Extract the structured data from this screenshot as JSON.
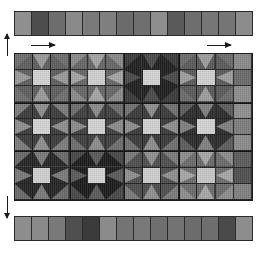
{
  "figure": {
    "type": "quilt-block-diagram",
    "title": "",
    "palette": {
      "bg": "#ffffff",
      "grid_line": "#1f1f1f",
      "block_line": "#141414",
      "arrow": "#1a1a1a",
      "light": "#c9c9c9",
      "pale": "#a8a8a8",
      "mid": "#7d7d7d",
      "medium": "#6a6a6a",
      "dark": "#4a4a4a",
      "darker": "#383838",
      "darkest": "#242424",
      "near_black": "#1b1b1b"
    }
  },
  "top_strip": {
    "label": "top border strip",
    "cell_count": 14,
    "cells": [
      "#8f8f8f",
      "#4d4d4d",
      "#6d6d6d",
      "#8a8a8a",
      "#7a7a7a",
      "#7f7f7f",
      "#6b6b6b",
      "#6f6f6f",
      "#8e8e8e",
      "#5a5a5a",
      "#6e6e6e",
      "#767676",
      "#757575",
      "#8c8c8c"
    ]
  },
  "bottom_strip": {
    "label": "bottom border strip",
    "cell_count": 14,
    "cells": [
      "#8d8d8d",
      "#8a8a8a",
      "#797979",
      "#4f4f4f",
      "#3b3b3b",
      "#8b8b8b",
      "#747474",
      "#797979",
      "#6f6f6f",
      "#737373",
      "#6c6c6c",
      "#6e6e6e",
      "#4a4a4a",
      "#8d8d8d"
    ]
  },
  "quilt": {
    "label": "central pieced quilt panel",
    "columns": 13,
    "rows": 9,
    "block_columns": 4,
    "block_rows": 3,
    "note": "Variable-Star / Ohio-Star blocks on a 3x3 cell module; corner cells plain, edge cells half-square triangles, center cell a light square.",
    "blocks": [
      {
        "row": 0,
        "col": 0,
        "star": "#5e5e5e",
        "bg": "#9a9a9a",
        "center": "#d2d2d2",
        "corner": "#6e6e6e"
      },
      {
        "row": 0,
        "col": 1,
        "star": "#666666",
        "bg": "#a4a4a4",
        "center": "#cfcfcf",
        "corner": "#8a8a8a"
      },
      {
        "row": 0,
        "col": 2,
        "star": "#1f1f1f",
        "bg": "#4a4a4a",
        "center": "#d4d4d4",
        "corner": "#3a3a3a"
      },
      {
        "row": 0,
        "col": 3,
        "star": "#5a5a5a",
        "bg": "#9d9d9d",
        "center": "#d0d0d0",
        "corner": "#6b6b6b"
      },
      {
        "row": 1,
        "col": 0,
        "star": "#3c3c3c",
        "bg": "#8e8e8e",
        "center": "#d3d3d3",
        "corner": "#7c7c7c"
      },
      {
        "row": 1,
        "col": 1,
        "star": "#3f3f3f",
        "bg": "#8b8b8b",
        "center": "#d2d2d2",
        "corner": "#6d6d6d"
      },
      {
        "row": 1,
        "col": 2,
        "star": "#3a3a3a",
        "bg": "#8d8d8d",
        "center": "#d1d1d1",
        "corner": "#707070"
      },
      {
        "row": 1,
        "col": 3,
        "star": "#2c2c2c",
        "bg": "#7f7f7f",
        "center": "#d3d3d3",
        "corner": "#5c5c5c"
      },
      {
        "row": 2,
        "col": 0,
        "star": "#252525",
        "bg": "#7a7a7a",
        "center": "#cfcfcf",
        "corner": "#6a6a6a"
      },
      {
        "row": 2,
        "col": 1,
        "star": "#1b1b1b",
        "bg": "#5a5a5a",
        "center": "#d4d4d4",
        "corner": "#474747"
      },
      {
        "row": 2,
        "col": 2,
        "star": "#4e4e4e",
        "bg": "#8f8f8f",
        "center": "#cdcdcd",
        "corner": "#7a7a7a"
      },
      {
        "row": 2,
        "col": 3,
        "star": "#6b6b6b",
        "bg": "#a6a6a6",
        "center": "#c6c6c6",
        "corner": "#8c8c8c"
      }
    ],
    "right_column_cells": [
      "#8a8a8a",
      "#6a6a6a",
      "#8c8c8c",
      "#8e8e8e",
      "#7d7d7d",
      "#8b8b8b",
      "#5c5c5c",
      "#4f4f4f",
      "#7f7f7f"
    ]
  },
  "annotations": {
    "arrow_top_left": {
      "name": "width-measure-arrow-left",
      "direction": "right"
    },
    "arrow_top_right": {
      "name": "width-measure-arrow-right",
      "direction": "right"
    },
    "arrow_left_top": {
      "name": "height-measure-arrow-top",
      "direction": "up"
    },
    "arrow_left_bottom": {
      "name": "height-measure-arrow-bottom",
      "direction": "down"
    }
  }
}
